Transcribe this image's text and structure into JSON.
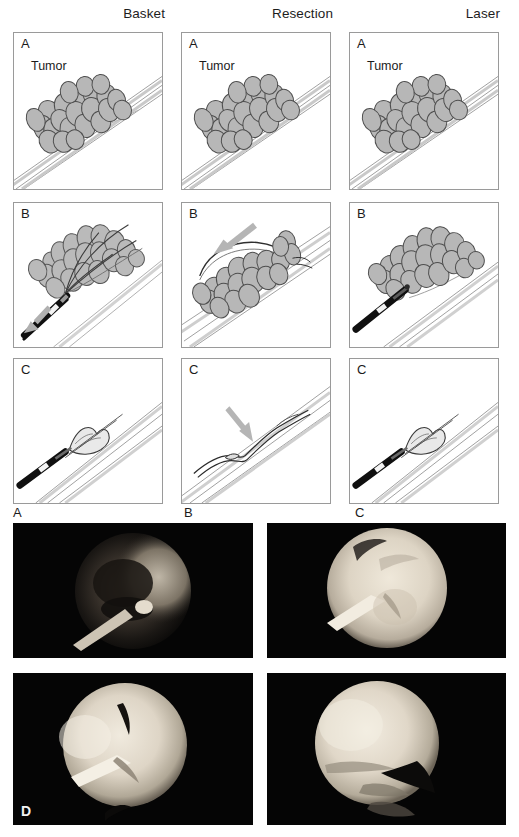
{
  "figure": {
    "type": "multi-panel medical illustration and endoscopic photograph figure",
    "columns": [
      {
        "label": "Basket",
        "name": "basket"
      },
      {
        "label": "Resection",
        "name": "resection"
      },
      {
        "label": "Laser",
        "name": "laser"
      }
    ],
    "row_letters": [
      "A",
      "B",
      "C"
    ],
    "tumor_label": "Tumor",
    "panels": [
      {
        "id": "basket-a",
        "letter": "A",
        "column": "Basket",
        "row": "A",
        "caption_text": "Tumor"
      },
      {
        "id": "resection-a",
        "letter": "A",
        "column": "Resection",
        "row": "A",
        "caption_text": "Tumor"
      },
      {
        "id": "laser-a",
        "letter": "A",
        "column": "Laser",
        "row": "A",
        "caption_text": "Tumor"
      },
      {
        "id": "basket-b",
        "letter": "B",
        "column": "Basket",
        "row": "B",
        "caption_text": ""
      },
      {
        "id": "resection-b",
        "letter": "B",
        "column": "Resection",
        "row": "B",
        "caption_text": ""
      },
      {
        "id": "laser-b",
        "letter": "B",
        "column": "Laser",
        "row": "B",
        "caption_text": ""
      },
      {
        "id": "basket-c",
        "letter": "C",
        "column": "Basket",
        "row": "C",
        "caption_text": ""
      },
      {
        "id": "resection-c",
        "letter": "C",
        "column": "Resection",
        "row": "C",
        "caption_text": ""
      },
      {
        "id": "laser-c",
        "letter": "C",
        "column": "Laser",
        "row": "C",
        "caption_text": ""
      }
    ],
    "sub_figure_letters": [
      {
        "letter": "A",
        "name": "subfigure-letter-a"
      },
      {
        "letter": "B",
        "name": "subfigure-letter-b"
      },
      {
        "letter": "C",
        "name": "subfigure-letter-c"
      }
    ],
    "photos": [
      {
        "id": "photo-top-left",
        "letter": ""
      },
      {
        "id": "photo-top-right",
        "letter": ""
      },
      {
        "id": "photo-bottom-left",
        "letter": "D"
      },
      {
        "id": "photo-bottom-right",
        "letter": ""
      }
    ],
    "colors": {
      "panel_border": "#9a9a9a",
      "tumor_fill": "#b7b7b7",
      "tumor_outline": "#4a4a4a",
      "duct_line": "#8d8d8d",
      "instrument_black": "#101010",
      "arrow_gray": "#a9a9a9",
      "photo_background": "#050505",
      "text": "#1b1b1b"
    }
  }
}
